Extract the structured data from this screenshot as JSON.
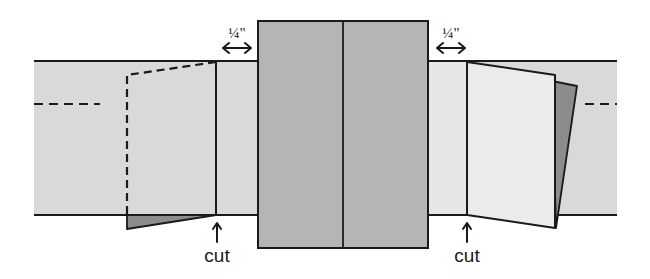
{
  "diagram": {
    "type": "paper-folding-cut-diagram",
    "labels": {
      "left_measure": "¼\"",
      "right_measure": "¼\"",
      "left_cut": "cut",
      "right_cut": "cut"
    },
    "colors": {
      "background": "#ffffff",
      "band_fill": "#d9d9d9",
      "center_panel_fill": "#b5b5b5",
      "light_flap_fill": "#ebebeb",
      "dark_flap_fill": "#8c8c8c",
      "stroke": "#1a1a1a"
    }
  }
}
